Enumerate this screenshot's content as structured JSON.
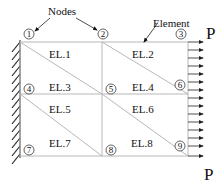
{
  "diagram": {
    "type": "finite-element-mesh",
    "callouts": {
      "nodes_label": "Nodes",
      "element_label": "Element"
    },
    "load_label_top": "P",
    "load_label_bottom": "P",
    "nodes": [
      {
        "id": "1",
        "label": "1"
      },
      {
        "id": "2",
        "label": "2"
      },
      {
        "id": "3",
        "label": "3"
      },
      {
        "id": "4",
        "label": "4"
      },
      {
        "id": "5",
        "label": "5"
      },
      {
        "id": "6",
        "label": "6"
      },
      {
        "id": "7",
        "label": "7"
      },
      {
        "id": "8",
        "label": "8"
      },
      {
        "id": "9",
        "label": "9"
      }
    ],
    "elements": [
      {
        "id": "EL1",
        "label": "EL.1"
      },
      {
        "id": "EL2",
        "label": "EL.2"
      },
      {
        "id": "EL3",
        "label": "EL.3"
      },
      {
        "id": "EL4",
        "label": "EL.4"
      },
      {
        "id": "EL5",
        "label": "EL.5"
      },
      {
        "id": "EL6",
        "label": "EL.6"
      },
      {
        "id": "EL7",
        "label": "EL.7"
      },
      {
        "id": "EL8",
        "label": "EL.8"
      }
    ],
    "support": "fixed-wall-left",
    "load_arrow_count": 15,
    "colors": {
      "mesh_line": "#b8b8b8",
      "ink": "#111111"
    }
  }
}
